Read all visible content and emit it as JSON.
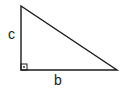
{
  "diagram": {
    "type": "right-triangle",
    "vertices": {
      "top": [
        21,
        6
      ],
      "right_angle": [
        21,
        70
      ],
      "bottom_right": [
        117,
        70
      ]
    },
    "labels": {
      "vertical_side": "c",
      "horizontal_side": "b"
    },
    "right_angle_marker": true,
    "stroke_color": "#1a1a1a",
    "background": "#ffffff"
  }
}
